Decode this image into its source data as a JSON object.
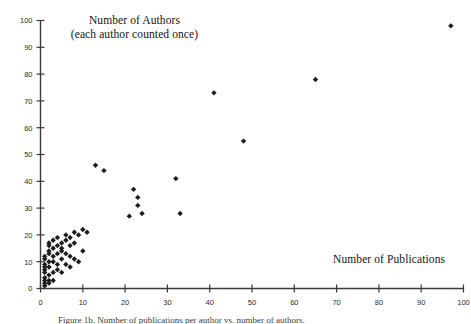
{
  "figure": {
    "y_axis_title_line1": "Number of Authors",
    "y_axis_title_line2": "(each author counted once)",
    "x_axis_title": "Number of Publications",
    "caption": "Figure 1b. Number of publications per author vs. number of authors.",
    "marker_color": "#1c1c1c",
    "axis_color": "#3a3a3a",
    "background_color": "#ffffff"
  },
  "chart_data": {
    "type": "scatter",
    "title": "Number of Authors (each author counted once)",
    "xlabel": "Number of Publications",
    "ylabel": "Number of Authors",
    "xlim": [
      0,
      100
    ],
    "ylim": [
      0,
      100
    ],
    "xticks": [
      0,
      10,
      20,
      30,
      40,
      50,
      60,
      70,
      80,
      90,
      100
    ],
    "yticks": [
      0,
      10,
      20,
      30,
      40,
      50,
      60,
      70,
      80,
      90,
      100
    ],
    "grid": false,
    "legend": false,
    "marker": "diamond",
    "series": [
      {
        "name": "authors per publication count",
        "points": [
          [
            1,
            1
          ],
          [
            1,
            2
          ],
          [
            1,
            3
          ],
          [
            1,
            4
          ],
          [
            1,
            6
          ],
          [
            1,
            7
          ],
          [
            1,
            8
          ],
          [
            1,
            9
          ],
          [
            1,
            11
          ],
          [
            1,
            12
          ],
          [
            2,
            2
          ],
          [
            2,
            3
          ],
          [
            2,
            5
          ],
          [
            2,
            8
          ],
          [
            2,
            10
          ],
          [
            2,
            13
          ],
          [
            2,
            14
          ],
          [
            2,
            16
          ],
          [
            2,
            17
          ],
          [
            3,
            3
          ],
          [
            3,
            6
          ],
          [
            3,
            10
          ],
          [
            3,
            12
          ],
          [
            3,
            15
          ],
          [
            3,
            18
          ],
          [
            4,
            7
          ],
          [
            4,
            9
          ],
          [
            4,
            13
          ],
          [
            4,
            16
          ],
          [
            4,
            19
          ],
          [
            5,
            6
          ],
          [
            5,
            11
          ],
          [
            5,
            14
          ],
          [
            5,
            15
          ],
          [
            5,
            17
          ],
          [
            6,
            9
          ],
          [
            6,
            13
          ],
          [
            6,
            18
          ],
          [
            6,
            20
          ],
          [
            7,
            8
          ],
          [
            7,
            12
          ],
          [
            7,
            16
          ],
          [
            7,
            19
          ],
          [
            8,
            11
          ],
          [
            8,
            17
          ],
          [
            8,
            21
          ],
          [
            9,
            10
          ],
          [
            9,
            20
          ],
          [
            10,
            14
          ],
          [
            10,
            22
          ],
          [
            11,
            21
          ],
          [
            13,
            46
          ],
          [
            15,
            44
          ],
          [
            21,
            27
          ],
          [
            22,
            37
          ],
          [
            23,
            31
          ],
          [
            23,
            34
          ],
          [
            24,
            28
          ],
          [
            32,
            41
          ],
          [
            33,
            28
          ],
          [
            41,
            73
          ],
          [
            48,
            55
          ],
          [
            65,
            78
          ],
          [
            97,
            98
          ]
        ]
      }
    ]
  }
}
